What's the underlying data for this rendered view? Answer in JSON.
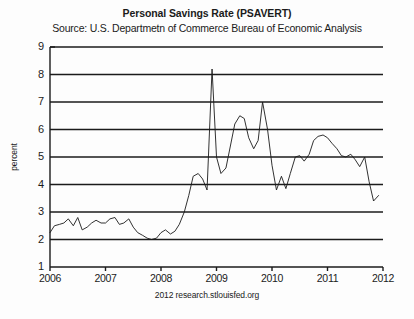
{
  "title": "Personal Savings Rate (PSAVERT)",
  "subtitle": "Source: U.S. Departmetn of Commerce Bureau of Economic Analysis",
  "footer": "2012 research.stlouisfed.org",
  "chart_data": {
    "type": "line",
    "title": "Personal Savings Rate (PSAVERT)",
    "subtitle": "Source: U.S. Departmetn of Commerce Bureau of Economic Analysis",
    "xlabel": "",
    "ylabel": "percent",
    "xlim": [
      2006,
      2012
    ],
    "ylim": [
      1,
      9
    ],
    "xticks": [
      "2006",
      "2007",
      "2008",
      "2009",
      "2010",
      "2011",
      "2012"
    ],
    "yticks": [
      "1",
      "2",
      "3",
      "4",
      "5",
      "6",
      "7",
      "8",
      "9"
    ],
    "grid": true,
    "grid_axis": "y",
    "legend": "none",
    "line_color": "#1b1b1b",
    "grid_color": "#1b1b1b",
    "axis_color": "#1b1b1b",
    "background": "#fdfdfd",
    "series": [
      {
        "name": "PSAVERT",
        "x": [
          2006.0,
          2006.08,
          2006.17,
          2006.25,
          2006.33,
          2006.42,
          2006.5,
          2006.58,
          2006.67,
          2006.75,
          2006.83,
          2006.92,
          2007.0,
          2007.08,
          2007.17,
          2007.25,
          2007.33,
          2007.42,
          2007.5,
          2007.58,
          2007.67,
          2007.75,
          2007.83,
          2007.92,
          2008.0,
          2008.08,
          2008.17,
          2008.25,
          2008.33,
          2008.42,
          2008.5,
          2008.58,
          2008.67,
          2008.75,
          2008.83,
          2008.92,
          2009.0,
          2009.08,
          2009.17,
          2009.25,
          2009.33,
          2009.42,
          2009.5,
          2009.58,
          2009.67,
          2009.75,
          2009.83,
          2009.92,
          2010.0,
          2010.08,
          2010.17,
          2010.25,
          2010.33,
          2010.42,
          2010.5,
          2010.58,
          2010.67,
          2010.75,
          2010.83,
          2010.92,
          2011.0,
          2011.08,
          2011.17,
          2011.25,
          2011.33,
          2011.42,
          2011.5,
          2011.58,
          2011.67,
          2011.75,
          2011.83,
          2011.92
        ],
        "values": [
          2.25,
          2.5,
          2.55,
          2.6,
          2.75,
          2.5,
          2.8,
          2.35,
          2.45,
          2.6,
          2.7,
          2.6,
          2.6,
          2.75,
          2.8,
          2.55,
          2.6,
          2.75,
          2.45,
          2.25,
          2.15,
          2.05,
          2.0,
          2.05,
          2.25,
          2.35,
          2.2,
          2.3,
          2.55,
          3.0,
          3.6,
          4.3,
          4.4,
          4.2,
          3.8,
          8.2,
          5.0,
          4.4,
          4.6,
          5.4,
          6.2,
          6.5,
          6.4,
          5.7,
          5.3,
          5.6,
          7.0,
          6.0,
          4.7,
          3.8,
          4.3,
          3.85,
          4.4,
          5.0,
          5.05,
          4.85,
          5.1,
          5.6,
          5.75,
          5.8,
          5.7,
          5.5,
          5.3,
          5.05,
          5.0,
          5.1,
          4.9,
          4.65,
          5.0,
          4.1,
          3.4,
          3.6
        ]
      }
    ]
  }
}
